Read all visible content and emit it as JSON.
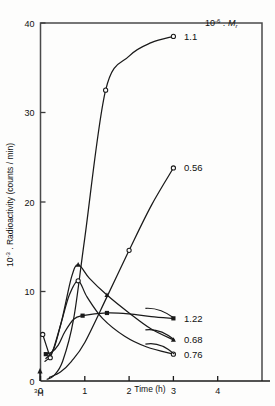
{
  "figure": {
    "background": "#fdfdfc",
    "line_color": "#1a1a1a",
    "frame_color": "#4a4a4a"
  },
  "chart_data": {
    "type": "line",
    "title": "",
    "xlabel": "Time (h)",
    "ylabel": "10^-3 . Radioactivity (counts / min)",
    "ylabel_prefix": "10",
    "ylabel_exponent": "-3",
    "ylabel_rest": " . Radioactivity (counts / min)",
    "xlim": [
      0,
      5
    ],
    "ylim": [
      0,
      40
    ],
    "xticks": [
      0,
      1,
      2,
      3,
      4
    ],
    "xtick_labels": [
      "0",
      "1",
      "2",
      "3",
      "4"
    ],
    "yticks": [
      0,
      10,
      20,
      30,
      40
    ],
    "ytick_labels": [
      "0",
      "10",
      "20",
      "30",
      "40"
    ],
    "grid": false,
    "legend_position": "inline-right-of-curve",
    "legend_header": "10^-6 . Mr",
    "legend_header_prefix": "10",
    "legend_header_exponent": "-6",
    "legend_header_mid": " . ",
    "legend_header_symbol": "M",
    "legend_header_subscript": "r",
    "origin_annotation": "3H",
    "origin_annotation_sup": "3",
    "origin_annotation_base": "H",
    "series": [
      {
        "name": "1.1",
        "label": "1.1",
        "marker": "open-circle",
        "x": [
          0.15,
          0.3,
          0.5,
          0.75,
          1.0,
          1.47,
          2.0,
          2.5,
          3.0
        ],
        "y": [
          0.2,
          0.6,
          2.2,
          7.0,
          16.0,
          32.5,
          36.3,
          37.8,
          38.5
        ],
        "marker_points": [
          [
            1.47,
            32.5
          ],
          [
            3.0,
            38.5
          ]
        ],
        "label_at": [
          3.15,
          38.5
        ]
      },
      {
        "name": "0.56",
        "label": "0.56",
        "marker": "open-circle",
        "x": [
          0.2,
          0.45,
          0.7,
          1.0,
          1.5,
          2.0,
          2.5,
          3.0
        ],
        "y": [
          0.4,
          1.0,
          2.2,
          4.3,
          9.4,
          14.6,
          19.6,
          23.8
        ],
        "marker_points": [
          [
            2.0,
            14.6
          ],
          [
            3.0,
            23.8
          ]
        ],
        "label_at": [
          3.15,
          23.8
        ]
      },
      {
        "name": "1.22",
        "label": "1.22",
        "marker": "filled-square",
        "x": [
          0.12,
          0.25,
          0.4,
          0.55,
          0.75,
          0.95,
          1.5,
          2.0,
          2.5,
          3.0
        ],
        "y": [
          3.0,
          3.2,
          4.0,
          5.5,
          6.9,
          7.3,
          7.6,
          7.5,
          7.2,
          7.0
        ],
        "marker_points": [
          [
            0.12,
            3.0
          ],
          [
            0.95,
            7.3
          ],
          [
            1.5,
            7.6
          ],
          [
            3.0,
            7.0
          ]
        ],
        "label_at": [
          3.15,
          7.0
        ]
      },
      {
        "name": "0.68",
        "label": "0.68",
        "marker": "filled-triangle",
        "x": [
          0.12,
          0.3,
          0.5,
          0.7,
          0.85,
          1.1,
          1.5,
          2.0,
          2.5,
          3.0
        ],
        "y": [
          2.5,
          3.6,
          7.2,
          11.6,
          13.0,
          11.5,
          9.6,
          7.6,
          5.8,
          4.6
        ],
        "marker_points": [
          [
            0.85,
            13.0
          ],
          [
            1.5,
            9.6
          ],
          [
            3.0,
            4.6
          ]
        ],
        "label_at": [
          3.15,
          4.6
        ]
      },
      {
        "name": "0.76",
        "label": "0.76",
        "marker": "open-circle",
        "x": [
          0.1,
          0.25,
          0.45,
          0.65,
          0.85,
          1.05,
          1.4,
          1.9,
          2.4,
          3.0
        ],
        "y": [
          2.2,
          3.0,
          6.2,
          9.6,
          11.2,
          9.4,
          7.0,
          5.0,
          3.8,
          3.0
        ],
        "marker_points": [
          [
            0.85,
            11.2
          ],
          [
            3.0,
            3.0
          ]
        ],
        "label_at": [
          3.15,
          3.0
        ]
      },
      {
        "name": "early-open-circle",
        "label": "",
        "marker": "open-circle",
        "x": [
          0.05,
          0.22
        ],
        "y": [
          5.2,
          2.6
        ],
        "marker_points": [
          [
            0.05,
            5.2
          ],
          [
            0.22,
            2.6
          ]
        ],
        "label_at": null
      }
    ]
  }
}
